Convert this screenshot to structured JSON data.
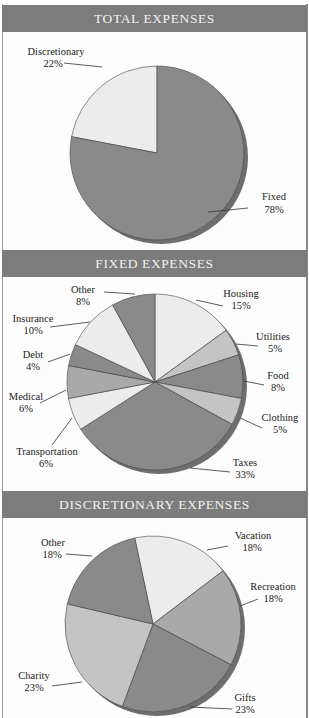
{
  "panels": [
    {
      "title": "TOTAL EXPENSES"
    },
    {
      "title": "FIXED EXPENSES"
    },
    {
      "title": "DISCRETIONARY EXPENSES"
    }
  ],
  "colors": {
    "header_bg": "#7c7c7c",
    "header_text": "#f2f2f2",
    "dark": "#8a8a8a",
    "medium": "#a9a9a9",
    "light": "#c4c4c4",
    "pale": "#ececec",
    "shadow": "#6e6e6e"
  },
  "chart_data": [
    {
      "type": "pie",
      "title": "TOTAL EXPENSES",
      "categories": [
        "Discretionary",
        "Fixed"
      ],
      "values": [
        22,
        78
      ],
      "labels": [
        "Discretionary 22%",
        "Fixed 78%"
      ]
    },
    {
      "type": "pie",
      "title": "FIXED EXPENSES",
      "categories": [
        "Housing",
        "Utilities",
        "Food",
        "Clothing",
        "Taxes",
        "Transportation",
        "Medical",
        "Debt",
        "Insurance",
        "Other"
      ],
      "values": [
        15,
        5,
        8,
        5,
        33,
        6,
        6,
        4,
        10,
        8
      ]
    },
    {
      "type": "pie",
      "title": "DISCRETIONARY EXPENSES",
      "categories": [
        "Vacation",
        "Recreation",
        "Gifts",
        "Charity",
        "Other"
      ],
      "values": [
        18,
        18,
        23,
        23,
        18
      ]
    }
  ],
  "labels": {
    "total": {
      "discretionary_name": "Discretionary",
      "discretionary_pct": "22%",
      "fixed_name": "Fixed",
      "fixed_pct": "78%"
    },
    "fixed": {
      "housing_name": "Housing",
      "housing_pct": "15%",
      "utilities_name": "Utilities",
      "utilities_pct": "5%",
      "food_name": "Food",
      "food_pct": "8%",
      "clothing_name": "Clothing",
      "clothing_pct": "5%",
      "taxes_name": "Taxes",
      "taxes_pct": "33%",
      "transportation_name": "Transportation",
      "transportation_pct": "6%",
      "medical_name": "Medical",
      "medical_pct": "6%",
      "debt_name": "Debt",
      "debt_pct": "4%",
      "insurance_name": "Insurance",
      "insurance_pct": "10%",
      "other_name": "Other",
      "other_pct": "8%"
    },
    "discretionary": {
      "vacation_name": "Vacation",
      "vacation_pct": "18%",
      "recreation_name": "Recreation",
      "recreation_pct": "18%",
      "gifts_name": "Gifts",
      "gifts_pct": "23%",
      "charity_name": "Charity",
      "charity_pct": "23%",
      "other_name": "Other",
      "other_pct": "18%"
    }
  }
}
